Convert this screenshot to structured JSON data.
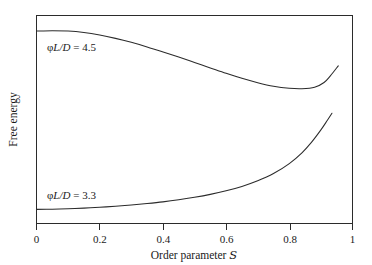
{
  "chart_data": {
    "type": "line",
    "title": "",
    "xlabel": "Order parameter ᵊ",
    "xlabel_prefix": "Order parameter ",
    "xlabel_symbol": "𝑆",
    "ylabel": "Free energy",
    "xlim": [
      0,
      1
    ],
    "ylim": [
      0,
      1
    ],
    "grid": false,
    "legend_position": "inline-annotations",
    "xticks": [
      {
        "value": 0,
        "label": "0"
      },
      {
        "value": 0.2,
        "label": "0.2"
      },
      {
        "value": 0.4,
        "label": "0.4"
      },
      {
        "value": 0.6,
        "label": "0.6"
      },
      {
        "value": 0.8,
        "label": "0.8"
      },
      {
        "value": 1,
        "label": "1"
      }
    ],
    "yticks": [],
    "series": [
      {
        "name": "φL/D = 4.5",
        "annotation_prefix": "φ",
        "annotation_italic": "L/D",
        "annotation_suffix": " = 4.5",
        "color": "#2b2b2b",
        "x": [
          0.0,
          0.05,
          0.1,
          0.15,
          0.2,
          0.25,
          0.3,
          0.35,
          0.4,
          0.45,
          0.5,
          0.55,
          0.6,
          0.65,
          0.7,
          0.75,
          0.8,
          0.84,
          0.88,
          0.91,
          0.93,
          0.955
        ],
        "y": [
          0.925,
          0.927,
          0.925,
          0.918,
          0.906,
          0.89,
          0.871,
          0.849,
          0.825,
          0.8,
          0.774,
          0.748,
          0.722,
          0.698,
          0.677,
          0.66,
          0.65,
          0.648,
          0.655,
          0.678,
          0.71,
          0.758
        ]
      },
      {
        "name": "φL/D = 3.3",
        "annotation_prefix": "φ",
        "annotation_italic": "L/D",
        "annotation_suffix": " = 3.3",
        "color": "#2b2b2b",
        "x": [
          0.0,
          0.05,
          0.1,
          0.15,
          0.2,
          0.25,
          0.3,
          0.35,
          0.4,
          0.45,
          0.5,
          0.55,
          0.6,
          0.65,
          0.7,
          0.75,
          0.8,
          0.84,
          0.87,
          0.9,
          0.92,
          0.935
        ],
        "y": [
          0.068,
          0.069,
          0.071,
          0.074,
          0.078,
          0.083,
          0.089,
          0.096,
          0.104,
          0.114,
          0.126,
          0.14,
          0.157,
          0.178,
          0.205,
          0.24,
          0.288,
          0.34,
          0.39,
          0.45,
          0.495,
          0.53
        ]
      }
    ],
    "annotations": [
      {
        "text": "φL/D = 4.5",
        "x": 0.035,
        "y": 0.845
      },
      {
        "text": "φL/D = 3.3",
        "x": 0.035,
        "y": 0.165
      }
    ]
  },
  "axes": {
    "x_title_prefix": "Order parameter ",
    "x_title_symbol": "𝑆",
    "y_title": "Free energy"
  }
}
